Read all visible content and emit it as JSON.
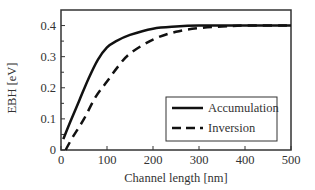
{
  "chart_data": {
    "type": "line",
    "title": "",
    "xlabel": "Channel length [nm]",
    "ylabel": "EBH [eV]",
    "xlim": [
      0,
      500
    ],
    "ylim": [
      0,
      0.45
    ],
    "xticks": [
      0,
      100,
      200,
      300,
      400,
      500
    ],
    "xtick_labels": [
      "0",
      "100",
      "200",
      "300",
      "400",
      "500"
    ],
    "yticks": [
      0,
      0.1,
      0.2,
      0.3,
      0.4
    ],
    "ytick_labels": [
      "0",
      "0.1",
      "0.2",
      "0.3",
      "0.4"
    ],
    "grid": false,
    "legend_position": "lower-right",
    "series": [
      {
        "name": "Accumulation",
        "style": "solid",
        "color": "#111111",
        "x": [
          5,
          20,
          40,
          60,
          80,
          100,
          120,
          150,
          200,
          250,
          300,
          400,
          500
        ],
        "y": [
          0.035,
          0.09,
          0.16,
          0.23,
          0.29,
          0.33,
          0.35,
          0.37,
          0.39,
          0.397,
          0.4,
          0.4,
          0.4
        ]
      },
      {
        "name": "Inversion",
        "style": "dashed",
        "color": "#111111",
        "x": [
          10,
          25,
          50,
          75,
          100,
          125,
          150,
          200,
          250,
          300,
          350,
          400,
          500
        ],
        "y": [
          0.0,
          0.04,
          0.1,
          0.17,
          0.22,
          0.27,
          0.31,
          0.355,
          0.38,
          0.392,
          0.397,
          0.4,
          0.4
        ]
      }
    ]
  }
}
